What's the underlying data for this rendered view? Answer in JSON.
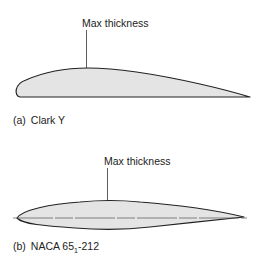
{
  "figure": {
    "panels": [
      {
        "id": "a",
        "caption_prefix": "(a)",
        "caption_name": "Clark  Y",
        "annotation": "Max thickness",
        "fill_color": "#e4e4e4",
        "stroke_color": "#222222"
      },
      {
        "id": "b",
        "caption_prefix": "(b)",
        "caption_name_main": "NACA 65",
        "caption_name_sub": "1",
        "caption_name_tail": "-212",
        "annotation": "Max thickness",
        "fill_color": "#e4e4e4",
        "stroke_color": "#222222",
        "chord_line": true
      }
    ]
  }
}
